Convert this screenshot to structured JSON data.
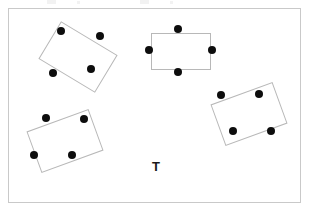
{
  "diagram": {
    "title": "",
    "background_color": "#ffffff",
    "frame": {
      "x": 8,
      "y": 8,
      "width": 293,
      "height": 195,
      "border_color": "#c9c9c9",
      "border_width": 1
    },
    "seat_color": "#0d0d0d",
    "seat_diameter": 8,
    "table_stroke_color": "#b8b8b8",
    "table_fill_color": "#ffffff",
    "labels": [
      {
        "name": "t-label",
        "text": "T",
        "x": 152,
        "y": 160,
        "font_size": 13,
        "color": "#1a1a1a",
        "bold": true
      }
    ],
    "top_artifacts": [
      {
        "x": 47,
        "y": 0,
        "width": 9,
        "height": 4
      },
      {
        "x": 77,
        "y": 1,
        "width": 3,
        "height": 3
      },
      {
        "x": 140,
        "y": 0,
        "width": 9,
        "height": 4
      },
      {
        "x": 170,
        "y": 1,
        "width": 3,
        "height": 3
      }
    ],
    "tables": [
      {
        "name": "table-top-left",
        "center_x": 78,
        "center_y": 57,
        "width": 66,
        "height": 44,
        "rotation_deg": 31,
        "seats": [
          {
            "name": "seat-1",
            "x": 61,
            "y": 31
          },
          {
            "name": "seat-2",
            "x": 100,
            "y": 36
          },
          {
            "name": "seat-3",
            "x": 53,
            "y": 73
          },
          {
            "name": "seat-4",
            "x": 91,
            "y": 69
          }
        ]
      },
      {
        "name": "table-top-middle",
        "center_x": 181,
        "center_y": 51,
        "width": 60,
        "height": 37,
        "rotation_deg": 0,
        "seats": [
          {
            "name": "seat-1",
            "x": 178,
            "y": 29
          },
          {
            "name": "seat-2",
            "x": 149,
            "y": 50
          },
          {
            "name": "seat-3",
            "x": 212,
            "y": 50
          },
          {
            "name": "seat-4",
            "x": 178,
            "y": 72
          }
        ]
      },
      {
        "name": "table-right",
        "center_x": 249,
        "center_y": 114,
        "width": 66,
        "height": 44,
        "rotation_deg": -20,
        "seats": [
          {
            "name": "seat-1",
            "x": 221,
            "y": 95
          },
          {
            "name": "seat-2",
            "x": 259,
            "y": 94
          },
          {
            "name": "seat-3",
            "x": 233,
            "y": 131
          },
          {
            "name": "seat-4",
            "x": 271,
            "y": 131
          }
        ]
      },
      {
        "name": "table-bottom-left",
        "center_x": 65,
        "center_y": 141,
        "width": 66,
        "height": 44,
        "rotation_deg": -20,
        "seats": [
          {
            "name": "seat-1",
            "x": 46,
            "y": 118
          },
          {
            "name": "seat-2",
            "x": 84,
            "y": 119
          },
          {
            "name": "seat-3",
            "x": 34,
            "y": 155
          },
          {
            "name": "seat-4",
            "x": 72,
            "y": 155
          }
        ]
      }
    ]
  }
}
